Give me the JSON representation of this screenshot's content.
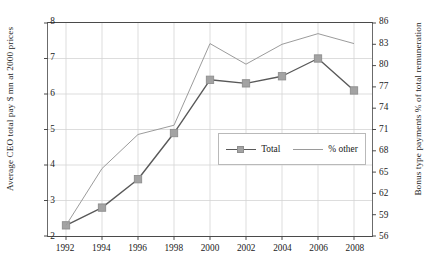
{
  "chart_data": {
    "type": "line",
    "title": "",
    "xlabel": "",
    "ylabel": "Average CEO total pay $ mn at 2000 prices",
    "y2label": "Bonus type payments % of total remuneration",
    "grid": true,
    "legend_position": "center-right",
    "x": [
      1992,
      1994,
      1996,
      1998,
      2000,
      2002,
      2004,
      2006,
      2008
    ],
    "xtick_labels": [
      "1992",
      "1994",
      "1996",
      "1998",
      "2000",
      "2002",
      "2004",
      "2006",
      "2008"
    ],
    "xlim": [
      1991,
      2009
    ],
    "ylim": [
      2,
      8
    ],
    "ytick_labels": [
      "2",
      "3",
      "4",
      "5",
      "6",
      "7",
      "8"
    ],
    "yticks": [
      2,
      3,
      4,
      5,
      6,
      7,
      8
    ],
    "y2lim": [
      56,
      86
    ],
    "y2tick_labels": [
      "56",
      "59",
      "62",
      "65",
      "68",
      "71",
      "74",
      "77",
      "80",
      "83",
      "86"
    ],
    "y2ticks": [
      56,
      59,
      62,
      65,
      68,
      71,
      74,
      77,
      80,
      83,
      86
    ],
    "series": [
      {
        "name": "Total",
        "axis": "left",
        "marker": "square",
        "color": "#595959",
        "marker_color": "#a3a3a3",
        "values": [
          2.3,
          2.8,
          3.6,
          4.9,
          6.4,
          6.3,
          6.5,
          7.0,
          6.1
        ]
      },
      {
        "name": "% other",
        "axis": "right",
        "marker": "none",
        "color": "#9a9a9a",
        "values": [
          57.5,
          65.5,
          70.3,
          71.6,
          83.1,
          80.2,
          83.0,
          84.5,
          83.1
        ]
      }
    ]
  },
  "legend": {
    "entries": [
      {
        "label": "Total"
      },
      {
        "label": "% other"
      }
    ]
  },
  "axes": {
    "left_title": "Average CEO total pay $ mn at 2000 prices",
    "right_title": "Bonus type payments % of total remuneration"
  },
  "colors": {
    "total_line": "#595959",
    "total_marker": "#a3a3a3",
    "other_line": "#9a9a9a",
    "grid": "#d4d4d4",
    "axis": "#4a4a4a"
  }
}
